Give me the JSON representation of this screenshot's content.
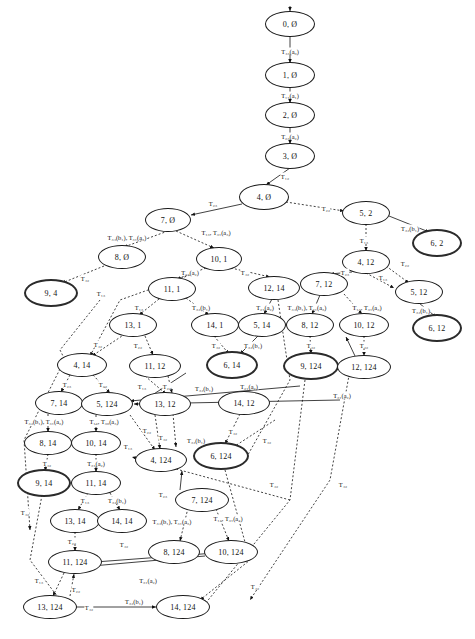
{
  "diagram": {
    "type": "state-transition-graph",
    "node_shape": "ellipse",
    "colors": {
      "node_stroke": "#1a1a1a",
      "bold_node_stroke": "#2b2b2b",
      "edge": "#111111",
      "background": "#ffffff"
    },
    "edge_styles": [
      "solid",
      "dotted"
    ],
    "nodes": [
      {
        "id": "n0",
        "label": "0, Ø",
        "x": 290,
        "y": 24,
        "rx": 24,
        "ry": 12,
        "bold": false
      },
      {
        "id": "n1",
        "label": "1, Ø",
        "x": 290,
        "y": 75,
        "rx": 24,
        "ry": 12,
        "bold": false
      },
      {
        "id": "n2",
        "label": "2, Ø",
        "x": 290,
        "y": 115,
        "rx": 24,
        "ry": 12,
        "bold": false
      },
      {
        "id": "n3",
        "label": "3, Ø",
        "x": 290,
        "y": 156,
        "rx": 24,
        "ry": 12,
        "bold": false
      },
      {
        "id": "n4",
        "label": "4, Ø",
        "x": 264,
        "y": 197,
        "rx": 24,
        "ry": 12,
        "bold": false
      },
      {
        "id": "n5",
        "label": "7, Ø",
        "x": 168,
        "y": 220,
        "rx": 22,
        "ry": 11,
        "bold": false
      },
      {
        "id": "n6",
        "label": "5, 2",
        "x": 366,
        "y": 213,
        "rx": 23,
        "ry": 11,
        "bold": false
      },
      {
        "id": "n7",
        "label": "6, 2",
        "x": 437,
        "y": 243,
        "rx": 23,
        "ry": 12,
        "bold": true
      },
      {
        "id": "n8",
        "label": "8, Ø",
        "x": 122,
        "y": 257,
        "rx": 23,
        "ry": 11,
        "bold": false
      },
      {
        "id": "n9",
        "label": "10, 1",
        "x": 219,
        "y": 259,
        "rx": 22,
        "ry": 11,
        "bold": false
      },
      {
        "id": "n10",
        "label": "4, 12",
        "x": 366,
        "y": 262,
        "rx": 23,
        "ry": 11,
        "bold": false
      },
      {
        "id": "n11",
        "label": "9, 4",
        "x": 51,
        "y": 293,
        "rx": 25,
        "ry": 12,
        "bold": true
      },
      {
        "id": "n12",
        "label": "11, 1",
        "x": 172,
        "y": 289,
        "rx": 23,
        "ry": 11,
        "bold": false
      },
      {
        "id": "n13",
        "label": "12, 14",
        "x": 274,
        "y": 288,
        "rx": 25,
        "ry": 11,
        "bold": false
      },
      {
        "id": "n14",
        "label": "7, 12",
        "x": 324,
        "y": 284,
        "rx": 23,
        "ry": 11,
        "bold": false
      },
      {
        "id": "n15",
        "label": "5, 12",
        "x": 419,
        "y": 292,
        "rx": 23,
        "ry": 11,
        "bold": false
      },
      {
        "id": "n16",
        "label": "13, 1",
        "x": 133,
        "y": 325,
        "rx": 23,
        "ry": 11,
        "bold": false
      },
      {
        "id": "n17",
        "label": "14, 1",
        "x": 215,
        "y": 325,
        "rx": 23,
        "ry": 11,
        "bold": false
      },
      {
        "id": "n18",
        "label": "5, 14",
        "x": 262,
        "y": 325,
        "rx": 23,
        "ry": 11,
        "bold": false
      },
      {
        "id": "n19",
        "label": "8, 12",
        "x": 310,
        "y": 325,
        "rx": 23,
        "ry": 11,
        "bold": false
      },
      {
        "id": "n20",
        "label": "10, 12",
        "x": 364,
        "y": 325,
        "rx": 24,
        "ry": 11,
        "bold": false
      },
      {
        "id": "n21",
        "label": "6, 12",
        "x": 437,
        "y": 328,
        "rx": 23,
        "ry": 12,
        "bold": true
      },
      {
        "id": "n22",
        "label": "4, 14",
        "x": 82,
        "y": 365,
        "rx": 24,
        "ry": 11,
        "bold": false
      },
      {
        "id": "n23",
        "label": "11, 12",
        "x": 155,
        "y": 366,
        "rx": 25,
        "ry": 11,
        "bold": false
      },
      {
        "id": "n24",
        "label": "6, 14",
        "x": 232,
        "y": 365,
        "rx": 24,
        "ry": 12,
        "bold": true
      },
      {
        "id": "n25",
        "label": "9, 124",
        "x": 311,
        "y": 366,
        "rx": 26,
        "ry": 12,
        "bold": true
      },
      {
        "id": "n26",
        "label": "12, 124",
        "x": 364,
        "y": 367,
        "rx": 26,
        "ry": 11,
        "bold": false
      },
      {
        "id": "n27",
        "label": "7, 14",
        "x": 59,
        "y": 403,
        "rx": 23,
        "ry": 11,
        "bold": false
      },
      {
        "id": "n28",
        "label": "5, 124",
        "x": 107,
        "y": 404,
        "rx": 25,
        "ry": 11,
        "bold": false
      },
      {
        "id": "n29",
        "label": "13, 12",
        "x": 165,
        "y": 404,
        "rx": 25,
        "ry": 11,
        "bold": false
      },
      {
        "id": "n30",
        "label": "14, 12",
        "x": 244,
        "y": 403,
        "rx": 25,
        "ry": 11,
        "bold": false
      },
      {
        "id": "n31",
        "label": "8, 14",
        "x": 48,
        "y": 443,
        "rx": 23,
        "ry": 11,
        "bold": false
      },
      {
        "id": "n32",
        "label": "10, 14",
        "x": 96,
        "y": 443,
        "rx": 24,
        "ry": 11,
        "bold": false
      },
      {
        "id": "n33",
        "label": "4, 124",
        "x": 161,
        "y": 460,
        "rx": 25,
        "ry": 11,
        "bold": false
      },
      {
        "id": "n34",
        "label": "6, 124",
        "x": 221,
        "y": 456,
        "rx": 26,
        "ry": 12,
        "bold": true
      },
      {
        "id": "n35",
        "label": "9, 14",
        "x": 44,
        "y": 483,
        "rx": 25,
        "ry": 12,
        "bold": true
      },
      {
        "id": "n36",
        "label": "11, 14",
        "x": 96,
        "y": 483,
        "rx": 24,
        "ry": 11,
        "bold": false
      },
      {
        "id": "n37",
        "label": "7, 124",
        "x": 202,
        "y": 500,
        "rx": 26,
        "ry": 11,
        "bold": false
      },
      {
        "id": "n38",
        "label": "13, 14",
        "x": 75,
        "y": 521,
        "rx": 24,
        "ry": 11,
        "bold": false
      },
      {
        "id": "n39",
        "label": "14, 14",
        "x": 122,
        "y": 521,
        "rx": 24,
        "ry": 11,
        "bold": false
      },
      {
        "id": "n40",
        "label": "8, 124",
        "x": 174,
        "y": 552,
        "rx": 25,
        "ry": 11,
        "bold": false
      },
      {
        "id": "n41",
        "label": "10, 124",
        "x": 231,
        "y": 552,
        "rx": 26,
        "ry": 11,
        "bold": false
      },
      {
        "id": "n42",
        "label": "11, 124",
        "x": 75,
        "y": 562,
        "rx": 26,
        "ry": 11,
        "bold": false
      },
      {
        "id": "n43",
        "label": "13, 124",
        "x": 50,
        "y": 607,
        "rx": 26,
        "ry": 11,
        "bold": false
      },
      {
        "id": "n44",
        "label": "14, 124",
        "x": 183,
        "y": 607,
        "rx": 26,
        "ry": 11,
        "bold": false
      }
    ],
    "edge_labels": [
      {
        "id": "l1",
        "text": "T₄₃(a₀)",
        "x": 290,
        "y": 51
      },
      {
        "id": "l2",
        "text": "T₁₁(a₁)",
        "x": 290,
        "y": 95
      },
      {
        "id": "l3",
        "text": "T₂₃(a₂)",
        "x": 290,
        "y": 136
      },
      {
        "id": "l4",
        "text": "T₁₂",
        "x": 285,
        "y": 176
      },
      {
        "id": "l5",
        "text": "T₂₃",
        "x": 213,
        "y": 203
      },
      {
        "id": "l6",
        "text": "T₂₂",
        "x": 326,
        "y": 208
      },
      {
        "id": "l7",
        "text": "T₃₄(b₁), T₃₁(a₃)",
        "x": 127,
        "y": 237
      },
      {
        "id": "l8",
        "text": "T₁₃, T₃₁(a₃)",
        "x": 216,
        "y": 232
      },
      {
        "id": "l9",
        "text": "T₃₄(b₁)",
        "x": 410,
        "y": 228
      },
      {
        "id": "l10",
        "text": "T₁₃",
        "x": 364,
        "y": 240
      },
      {
        "id": "l11",
        "text": "T₄₂",
        "x": 85,
        "y": 278
      },
      {
        "id": "l12",
        "text": "T₂₃(a₂)",
        "x": 190,
        "y": 272
      },
      {
        "id": "l13",
        "text": "T₄₂",
        "x": 245,
        "y": 272
      },
      {
        "id": "l14",
        "text": "T₂₃",
        "x": 345,
        "y": 272
      },
      {
        "id": "l15",
        "text": "T₂₂",
        "x": 405,
        "y": 263
      },
      {
        "id": "l16",
        "text": "T₁₃",
        "x": 383,
        "y": 277
      },
      {
        "id": "l17",
        "text": "T₁₃",
        "x": 101,
        "y": 293
      },
      {
        "id": "l18",
        "text": "T₁₃",
        "x": 139,
        "y": 307
      },
      {
        "id": "l19",
        "text": "T₃₄(b₁)",
        "x": 201,
        "y": 307
      },
      {
        "id": "l20",
        "text": "T₂₁(a₂)",
        "x": 265,
        "y": 307
      },
      {
        "id": "l21",
        "text": "T₃₄(b₁), T₃₁(a₃)",
        "x": 307,
        "y": 307
      },
      {
        "id": "l22",
        "text": "T₁₃, T₃₁(a₃)",
        "x": 367,
        "y": 307
      },
      {
        "id": "l23",
        "text": "T₃₄(b₁)",
        "x": 421,
        "y": 310
      },
      {
        "id": "l24",
        "text": "T₄₂",
        "x": 98,
        "y": 344
      },
      {
        "id": "l25",
        "text": "T₂₂",
        "x": 138,
        "y": 345
      },
      {
        "id": "l26",
        "text": "T₄₂",
        "x": 216,
        "y": 345
      },
      {
        "id": "l27",
        "text": "T₃₄(b₁)",
        "x": 253,
        "y": 345
      },
      {
        "id": "l28",
        "text": "T₄₂",
        "x": 311,
        "y": 345
      },
      {
        "id": "l29",
        "text": "T₄₂",
        "x": 364,
        "y": 345
      },
      {
        "id": "l30",
        "text": "T₂₃",
        "x": 67,
        "y": 384
      },
      {
        "id": "l31",
        "text": "T₂₂",
        "x": 103,
        "y": 384
      },
      {
        "id": "l32",
        "text": "T₁₃",
        "x": 142,
        "y": 386
      },
      {
        "id": "l33",
        "text": "T₂₂",
        "x": 167,
        "y": 386
      },
      {
        "id": "l34",
        "text": "T₃₄(b₁)",
        "x": 204,
        "y": 388
      },
      {
        "id": "l35",
        "text": "T₂₁(a₂)",
        "x": 249,
        "y": 386
      },
      {
        "id": "l36",
        "text": "T₃₁(a₂)",
        "x": 342,
        "y": 395
      },
      {
        "id": "l37",
        "text": "T₃₄(b₁), T₃₁(a₂)",
        "x": 44,
        "y": 421
      },
      {
        "id": "l38",
        "text": "T₁₃, T₃₀(a₃)",
        "x": 104,
        "y": 421
      },
      {
        "id": "l39",
        "text": "T₂₂",
        "x": 147,
        "y": 430
      },
      {
        "id": "l40",
        "text": "T₄₂",
        "x": 163,
        "y": 437
      },
      {
        "id": "l41",
        "text": "T₃₄(b₁)",
        "x": 196,
        "y": 440
      },
      {
        "id": "l42",
        "text": "T₄₂",
        "x": 233,
        "y": 431
      },
      {
        "id": "l43",
        "text": "T₄₂",
        "x": 267,
        "y": 440
      },
      {
        "id": "l44",
        "text": "T₁₃",
        "x": 128,
        "y": 446
      },
      {
        "id": "l45",
        "text": "T₄₂",
        "x": 47,
        "y": 463
      },
      {
        "id": "l46",
        "text": "T₃₁(a₂)",
        "x": 96,
        "y": 463
      },
      {
        "id": "l47",
        "text": "T₂₃",
        "x": 163,
        "y": 494
      },
      {
        "id": "l48",
        "text": "T₄₂",
        "x": 274,
        "y": 484
      },
      {
        "id": "l49",
        "text": "T₄₂",
        "x": 343,
        "y": 484
      },
      {
        "id": "l50",
        "text": "T₁₃",
        "x": 85,
        "y": 500
      },
      {
        "id": "l51",
        "text": "T₃₄(b₁)",
        "x": 117,
        "y": 500
      },
      {
        "id": "l52",
        "text": "T₄₂",
        "x": 25,
        "y": 512
      },
      {
        "id": "l53",
        "text": "T₃₄(b₁), T₃₁(a₃)",
        "x": 172,
        "y": 521
      },
      {
        "id": "l54",
        "text": "T₁₃, T₃₁(a₃)",
        "x": 228,
        "y": 518
      },
      {
        "id": "l55",
        "text": "T₂₂",
        "x": 72,
        "y": 541
      },
      {
        "id": "l56",
        "text": "T₄₂",
        "x": 124,
        "y": 544
      },
      {
        "id": "l57",
        "text": "T₁₃",
        "x": 39,
        "y": 580
      },
      {
        "id": "l58",
        "text": "T₂₂",
        "x": 76,
        "y": 589
      },
      {
        "id": "l59",
        "text": "T₃₁(a₂)",
        "x": 148,
        "y": 580
      },
      {
        "id": "l60",
        "text": "T₄₂",
        "x": 255,
        "y": 586
      },
      {
        "id": "l61",
        "text": "T₄₂",
        "x": 89,
        "y": 607
      },
      {
        "id": "l62",
        "text": "T₃₄(b₁)",
        "x": 134,
        "y": 601
      }
    ]
  }
}
